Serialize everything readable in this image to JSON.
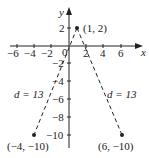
{
  "axes": {
    "x_label": "x",
    "y_label": "y",
    "origin_label": "0",
    "x_ticks": [
      {
        "value": -6,
        "label": "−6"
      },
      {
        "value": -4,
        "label": "−4"
      },
      {
        "value": -2,
        "label": "−2"
      },
      {
        "value": 2,
        "label": "2"
      },
      {
        "value": 4,
        "label": "4"
      },
      {
        "value": 6,
        "label": "6"
      }
    ],
    "y_ticks": [
      {
        "value": 2,
        "label": "2"
      },
      {
        "value": -2,
        "label": "−2"
      },
      {
        "value": -4,
        "label": "−4"
      },
      {
        "value": -6,
        "label": "−6"
      },
      {
        "value": -8,
        "label": "−8"
      },
      {
        "value": -10,
        "label": "−10"
      }
    ]
  },
  "points": [
    {
      "x": 1,
      "y": 2,
      "label": "(1, 2)"
    },
    {
      "x": -4,
      "y": -10,
      "label": "(−4, −10)"
    },
    {
      "x": 6,
      "y": -10,
      "label": "(6, −10)"
    }
  ],
  "segments": [
    {
      "from": "(1, 2)",
      "to": "(−4, −10)",
      "label": "d = 13"
    },
    {
      "from": "(1, 2)",
      "to": "(6, −10)",
      "label": "d = 13"
    }
  ],
  "colors": {
    "ink": "#222222",
    "background": "#ffffff"
  }
}
